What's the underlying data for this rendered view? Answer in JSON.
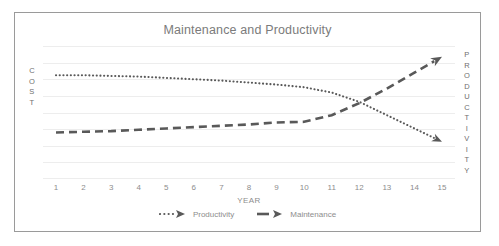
{
  "chart_data": {
    "type": "line",
    "title": "Maintenance and Productivity",
    "xlabel": "YEAR",
    "ylabel_left": "COST",
    "ylabel_right": "PRODUCTIVITY",
    "x": [
      1,
      2,
      3,
      4,
      5,
      6,
      7,
      8,
      9,
      10,
      11,
      12,
      13,
      14,
      15
    ],
    "categories": [
      "1",
      "2",
      "3",
      "4",
      "5",
      "6",
      "7",
      "8",
      "9",
      "10",
      "11",
      "12",
      "13",
      "14",
      "15"
    ],
    "xlim": [
      1,
      15
    ],
    "ylim": [
      0,
      100
    ],
    "grid": true,
    "grid_values": [
      100,
      87.5,
      75,
      62.5,
      50,
      37.5,
      25,
      12.5,
      0
    ],
    "legend_position": "bottom",
    "series": [
      {
        "name": "Productivity",
        "style": "dotted",
        "color": "#595959",
        "arrow_end": true,
        "values": [
          78,
          78,
          77.5,
          77,
          76,
          75,
          74,
          72.5,
          71,
          69,
          65,
          58,
          48,
          38,
          28
        ]
      },
      {
        "name": "Maintenance",
        "style": "dashed",
        "color": "#595959",
        "arrow_end": true,
        "values": [
          35,
          35.5,
          36,
          37,
          38,
          39,
          40,
          41,
          42.5,
          43,
          48,
          57,
          68,
          80,
          92
        ]
      }
    ]
  },
  "chart": {
    "title": "Maintenance and Productivity",
    "x_axis": {
      "title": "YEAR",
      "ticks": [
        "1",
        "2",
        "3",
        "4",
        "5",
        "6",
        "7",
        "8",
        "9",
        "10",
        "11",
        "12",
        "13",
        "14",
        "15"
      ]
    },
    "y_axis_left": {
      "title": "COST",
      "letters": [
        "C",
        "O",
        "S",
        "T"
      ]
    },
    "y_axis_right": {
      "title": "PRODUCTIVITY",
      "letters": [
        "P",
        "R",
        "O",
        "D",
        "U",
        "C",
        "T",
        "I",
        "V",
        "I",
        "T",
        "Y"
      ]
    },
    "legend": [
      {
        "label": "Productivity",
        "marker": "dotted-arrow-marker"
      },
      {
        "label": "Maintenance",
        "marker": "dashed-arrow-marker"
      }
    ],
    "colors": {
      "series": "#595959",
      "gridline": "#ededed",
      "border": "#9a9a9a",
      "title_text": "#7b7b7b",
      "axis_text": "#8d8d8d"
    }
  }
}
